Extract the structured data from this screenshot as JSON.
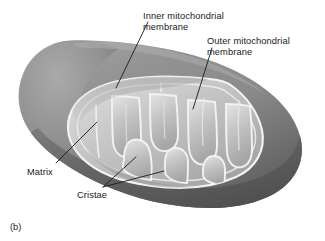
{
  "figure": {
    "caption": "(b)",
    "background_color": "#ffffff"
  },
  "labels": {
    "inner_membrane": {
      "line1": "Inner mitochondrial",
      "line2": "membrane",
      "name": "inner-mitochondrial-membrane"
    },
    "outer_membrane": {
      "line1": "Outer mitochondrial",
      "line2": "membrane",
      "name": "outer-mitochondrial-membrane"
    },
    "matrix": {
      "text": "Matrix",
      "name": "matrix"
    },
    "cristae": {
      "text": "Cristae",
      "name": "cristae"
    }
  },
  "colors": {
    "outer_body_light": "#9a9a9a",
    "outer_body_mid": "#868686",
    "outer_body_dark": "#636363",
    "outer_body_darkest": "#525252",
    "matrix_light": "#d2d2d2",
    "matrix_mid": "#b9b9b9",
    "matrix_shadow": "#9d9d9d",
    "membrane_line": "#f2f2f2",
    "leader_line": "#1a1a1a",
    "text": "#1a1a1a"
  },
  "leader_lines": [
    {
      "name": "leader-inner-membrane",
      "from": [
        148,
        22
      ],
      "to": [
        116,
        88
      ]
    },
    {
      "name": "leader-outer-membrane",
      "from": [
        212,
        48
      ],
      "to": [
        193,
        109
      ]
    },
    {
      "name": "leader-matrix",
      "from": [
        56,
        163
      ],
      "to": [
        97,
        122
      ]
    },
    {
      "name": "leader-cristae-a",
      "from": [
        103,
        187
      ],
      "to": [
        136,
        157
      ]
    },
    {
      "name": "leader-cristae-b",
      "from": [
        103,
        187
      ],
      "to": [
        164,
        171
      ]
    }
  ]
}
